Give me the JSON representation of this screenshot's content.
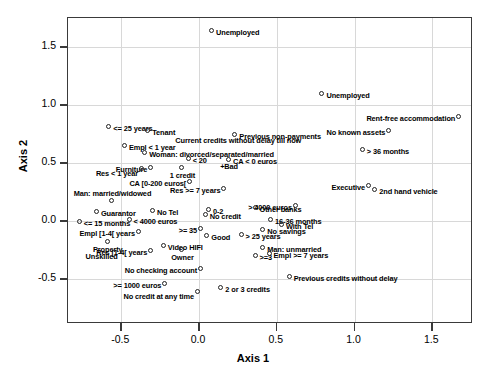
{
  "chart_data": {
    "type": "scatter",
    "title": "",
    "xlabel": "Axis 1",
    "ylabel": "Axis 2",
    "xlim": [
      -0.82,
      1.77
    ],
    "ylim": [
      -0.74,
      1.76
    ],
    "xticks": [
      "-0.5",
      "0.0",
      "0.5",
      "1.0",
      "1.5"
    ],
    "xtickvalues": [
      -0.5,
      0.0,
      0.5,
      1.0,
      1.5
    ],
    "yticks": [
      "1.5",
      "1.0",
      "0.5",
      "0.0",
      "-0.5"
    ],
    "ytickvalues": [
      1.5,
      1.0,
      0.5,
      0.0,
      -0.5
    ],
    "grid": true,
    "legend": "none",
    "marker": "open-circle",
    "points": [
      {
        "label": "Unemployed",
        "x": 0.09,
        "y": 1.63,
        "pos": "r"
      },
      {
        "label": "Unemployed",
        "x": 0.8,
        "y": 1.09,
        "pos": "r"
      },
      {
        "label": "Rent-free accommodation",
        "x": 1.68,
        "y": 0.89,
        "pos": "l"
      },
      {
        "label": "<= 25 years",
        "x": -0.57,
        "y": 0.8,
        "pos": "r"
      },
      {
        "label": "Tenant",
        "x": -0.32,
        "y": 0.77,
        "pos": "r"
      },
      {
        "label": "No known assets",
        "x": 1.23,
        "y": 0.77,
        "pos": "l"
      },
      {
        "label": "Previous non-payments",
        "x": 0.24,
        "y": 0.73,
        "pos": "r"
      },
      {
        "label": "Current credits without delay till now",
        "x": 0.24,
        "y": 0.68,
        "pos": "textonly"
      },
      {
        "label": "Empl < 1 year",
        "x": -0.47,
        "y": 0.64,
        "pos": "split"
      },
      {
        "label": "Woman: divorced/separated/married",
        "x": -0.34,
        "y": 0.58,
        "pos": "r"
      },
      {
        "label": "> 36 months",
        "x": 1.06,
        "y": 0.6,
        "pos": "r"
      },
      {
        "label": "< 20",
        "x": -0.06,
        "y": 0.53,
        "pos": "r"
      },
      {
        "label": "CA < 0 euros",
        "x": 0.2,
        "y": 0.52,
        "pos": "r"
      },
      {
        "label": "+Bad",
        "x": 0.2,
        "y": 0.46,
        "pos": "textonly"
      },
      {
        "label": "Furniture",
        "x": -0.3,
        "y": 0.45,
        "pos": "l"
      },
      {
        "label": "Res < 1 year",
        "x": -0.36,
        "y": 0.44,
        "pos": "lbelow"
      },
      {
        "label": "1 credit",
        "x": -0.1,
        "y": 0.45,
        "pos": "below"
      },
      {
        "label": "Executive",
        "x": 1.1,
        "y": 0.29,
        "pos": "l"
      },
      {
        "label": "2nd hand vehicle",
        "x": 1.14,
        "y": 0.26,
        "pos": "r"
      },
      {
        "label": "CA [0-200 euros[",
        "x": -0.05,
        "y": 0.33,
        "pos": "l"
      },
      {
        "label": "Res >= 7 years",
        "x": 0.17,
        "y": 0.27,
        "pos": "l"
      },
      {
        "label": "Man: married/widowed",
        "x": -0.55,
        "y": 0.16,
        "pos": "above"
      },
      {
        "label": "Guarantor",
        "x": -0.65,
        "y": 0.07,
        "pos": "r"
      },
      {
        "label": "No Tel",
        "x": -0.29,
        "y": 0.08,
        "pos": "r"
      },
      {
        "label": "0-2",
        "x": 0.07,
        "y": 0.09,
        "pos": "r"
      },
      {
        "label": "No credit",
        "x": 0.05,
        "y": 0.04,
        "pos": "r"
      },
      {
        "label": "Other banks",
        "x": 0.37,
        "y": 0.1,
        "pos": "r"
      },
      {
        "label": "> 4000 euros",
        "x": 0.63,
        "y": 0.12,
        "pos": "l"
      },
      {
        "label": "<= 15 months",
        "x": -0.76,
        "y": -0.02,
        "pos": "r"
      },
      {
        "label": "< 4000 euros",
        "x": -0.44,
        "y": 0.0,
        "pos": "r"
      },
      {
        "label": "16-36 months",
        "x": 0.47,
        "y": 0.0,
        "pos": "r"
      },
      {
        "label": "With Tel",
        "x": 0.54,
        "y": -0.04,
        "pos": "r"
      },
      {
        "label": "Empl [1-4[ years",
        "x": -0.38,
        "y": -0.1,
        "pos": "l"
      },
      {
        "label": ">= 35",
        "x": 0.02,
        "y": -0.08,
        "pos": "l"
      },
      {
        "label": "No savings",
        "x": 0.42,
        "y": -0.09,
        "pos": "r"
      },
      {
        "label": "Good",
        "x": 0.06,
        "y": -0.14,
        "pos": "r"
      },
      {
        "label": "> 25 years",
        "x": 0.28,
        "y": -0.13,
        "pos": "r"
      },
      {
        "label": "Property",
        "x": -0.58,
        "y": -0.19,
        "pos": "below"
      },
      {
        "label": "Video HIFI",
        "x": -0.22,
        "y": -0.22,
        "pos": "r"
      },
      {
        "label": "Res [1-4[ years",
        "x": -0.3,
        "y": -0.27,
        "pos": "l"
      },
      {
        "label": "Owner",
        "x": -0.1,
        "y": -0.26,
        "pos": "below"
      },
      {
        "label": "Man: unmarried",
        "x": 0.42,
        "y": -0.24,
        "pos": "r"
      },
      {
        "label": "Unskilled",
        "x": -0.62,
        "y": -0.32,
        "pos": "textonly"
      },
      {
        "label": ">=3",
        "x": 0.37,
        "y": -0.31,
        "pos": "r"
      },
      {
        "label": "Empl >= 7 years",
        "x": 0.46,
        "y": -0.29,
        "pos": "r"
      },
      {
        "label": "No checking account",
        "x": 0.02,
        "y": -0.42,
        "pos": "l"
      },
      {
        "label": "Previous credits without delay",
        "x": 0.59,
        "y": -0.49,
        "pos": "r"
      },
      {
        "label": ">= 1000 euros",
        "x": -0.21,
        "y": -0.55,
        "pos": "l"
      },
      {
        "label": "No credit at any time",
        "x": 0.0,
        "y": -0.62,
        "pos": "lbelow"
      },
      {
        "label": "2 or 3 credits",
        "x": 0.15,
        "y": -0.59,
        "pos": "r"
      }
    ]
  }
}
